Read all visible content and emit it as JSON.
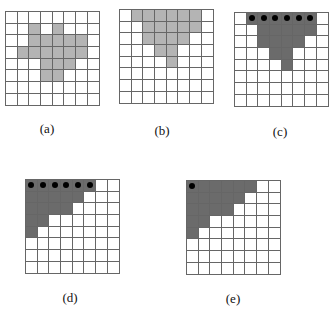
{
  "panels": [
    {
      "id": "a",
      "label": "(a)",
      "x": 5,
      "y": 11,
      "label_x": 47,
      "label_y": 121,
      "fill": "light",
      "cells": [
        [
          1,
          2
        ],
        [
          1,
          4
        ],
        [
          2,
          2
        ],
        [
          2,
          3
        ],
        [
          2,
          4
        ],
        [
          2,
          5
        ],
        [
          2,
          6
        ],
        [
          3,
          1
        ],
        [
          3,
          2
        ],
        [
          3,
          3
        ],
        [
          3,
          4
        ],
        [
          3,
          5
        ],
        [
          3,
          6
        ],
        [
          4,
          3
        ],
        [
          4,
          4
        ],
        [
          4,
          5
        ],
        [
          5,
          3
        ],
        [
          5,
          4
        ]
      ],
      "dots": []
    },
    {
      "id": "b",
      "label": "(b)",
      "x": 119,
      "y": 9,
      "label_x": 162,
      "label_y": 123,
      "fill": "light",
      "cells": [
        [
          0,
          1
        ],
        [
          0,
          2
        ],
        [
          0,
          3
        ],
        [
          0,
          4
        ],
        [
          0,
          5
        ],
        [
          0,
          6
        ],
        [
          1,
          2
        ],
        [
          1,
          3
        ],
        [
          1,
          4
        ],
        [
          1,
          5
        ],
        [
          1,
          6
        ],
        [
          2,
          2
        ],
        [
          2,
          3
        ],
        [
          2,
          4
        ],
        [
          2,
          5
        ],
        [
          3,
          3
        ],
        [
          3,
          4
        ],
        [
          4,
          4
        ]
      ],
      "dots": []
    },
    {
      "id": "c",
      "label": "(c)",
      "x": 234,
      "y": 12,
      "label_x": 280,
      "label_y": 124,
      "fill": "dark",
      "cells": [
        [
          0,
          1
        ],
        [
          0,
          2
        ],
        [
          0,
          3
        ],
        [
          0,
          4
        ],
        [
          0,
          5
        ],
        [
          0,
          6
        ],
        [
          1,
          2
        ],
        [
          1,
          3
        ],
        [
          1,
          4
        ],
        [
          1,
          5
        ],
        [
          1,
          6
        ],
        [
          2,
          2
        ],
        [
          2,
          3
        ],
        [
          2,
          4
        ],
        [
          2,
          5
        ],
        [
          3,
          3
        ],
        [
          3,
          4
        ],
        [
          4,
          4
        ]
      ],
      "dots": [
        [
          0,
          1
        ],
        [
          0,
          2
        ],
        [
          0,
          3
        ],
        [
          0,
          4
        ],
        [
          0,
          5
        ],
        [
          0,
          6
        ]
      ]
    },
    {
      "id": "d",
      "label": "(d)",
      "x": 25,
      "y": 179,
      "label_x": 70,
      "label_y": 290,
      "fill": "dark",
      "cells": [
        [
          0,
          0
        ],
        [
          0,
          1
        ],
        [
          0,
          2
        ],
        [
          0,
          3
        ],
        [
          0,
          4
        ],
        [
          0,
          5
        ],
        [
          1,
          0
        ],
        [
          1,
          1
        ],
        [
          1,
          2
        ],
        [
          1,
          3
        ],
        [
          1,
          4
        ],
        [
          2,
          0
        ],
        [
          2,
          1
        ],
        [
          2,
          2
        ],
        [
          2,
          3
        ],
        [
          3,
          0
        ],
        [
          3,
          1
        ],
        [
          4,
          0
        ]
      ],
      "dots": [
        [
          0,
          0
        ],
        [
          0,
          1
        ],
        [
          0,
          2
        ],
        [
          0,
          3
        ],
        [
          0,
          4
        ],
        [
          0,
          5
        ]
      ]
    },
    {
      "id": "e",
      "label": "(e)",
      "x": 186,
      "y": 180,
      "label_x": 233,
      "label_y": 291,
      "fill": "dark",
      "cells": [
        [
          0,
          0
        ],
        [
          0,
          1
        ],
        [
          0,
          2
        ],
        [
          0,
          3
        ],
        [
          0,
          4
        ],
        [
          0,
          5
        ],
        [
          1,
          0
        ],
        [
          1,
          1
        ],
        [
          1,
          2
        ],
        [
          1,
          3
        ],
        [
          1,
          4
        ],
        [
          2,
          0
        ],
        [
          2,
          1
        ],
        [
          2,
          2
        ],
        [
          2,
          3
        ],
        [
          3,
          0
        ],
        [
          3,
          1
        ],
        [
          4,
          0
        ]
      ],
      "dots": [
        [
          0,
          0
        ]
      ]
    }
  ],
  "grid_size": 8
}
